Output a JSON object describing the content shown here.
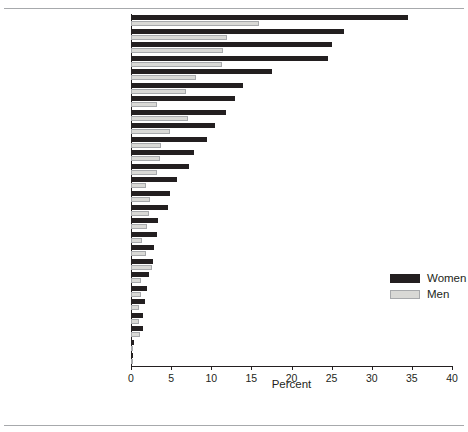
{
  "chart_data": {
    "type": "bar",
    "orientation": "horizontal",
    "title": "",
    "subtitle": "",
    "xlabel": "Percent",
    "ylabel": "",
    "xlim": [
      0,
      40
    ],
    "xticks": [
      0,
      5,
      10,
      15,
      20,
      25,
      30,
      35,
      40
    ],
    "grid": false,
    "legend": {
      "position": "right-middle",
      "entries": [
        {
          "name": "Women",
          "color": "#231f20"
        },
        {
          "name": "Men",
          "color": "#d9d9d6"
        }
      ]
    },
    "categories": [
      "Botswana",
      "Lesotho",
      "South Africa",
      "Zimbabwe",
      "Zambia",
      "Central African Republic",
      "Kenya",
      "Ethiopia",
      "Rwanda",
      "Côte d’Ivoire",
      "Tanzania",
      "Cameroon",
      "Burkina Faso",
      "Nigeria",
      "Gabon",
      "Cambodia",
      "Ghana",
      "Chad",
      "Dominican Republic",
      "Thailand",
      "Mali",
      "Myanmar",
      "Niger",
      "Honduras",
      "India",
      "Equatorial Guinea"
    ],
    "series": [
      {
        "name": "Women",
        "color": "#231f20",
        "values": [
          34.5,
          26.5,
          25.0,
          24.5,
          17.6,
          14.0,
          13.0,
          11.8,
          10.5,
          9.5,
          7.9,
          7.2,
          5.7,
          4.9,
          4.6,
          3.4,
          3.3,
          2.9,
          2.7,
          2.3,
          2.0,
          1.8,
          1.5,
          1.5,
          0.4,
          0.3
        ]
      },
      {
        "name": "Men",
        "color": "#d9d9d6",
        "values": [
          15.9,
          12.0,
          11.5,
          11.4,
          8.1,
          6.9,
          3.2,
          7.1,
          4.9,
          3.8,
          3.6,
          3.2,
          1.9,
          2.4,
          2.3,
          2.0,
          1.4,
          1.9,
          2.6,
          1.2,
          1.3,
          1.0,
          1.0,
          1.1,
          0.3,
          0.2
        ]
      }
    ]
  },
  "xlabel": "Percent",
  "legend": {
    "women_label": "Women",
    "men_label": "Men"
  },
  "ticklabels": [
    "0",
    "5",
    "10",
    "15",
    "20",
    "25",
    "30",
    "35",
    "40"
  ]
}
